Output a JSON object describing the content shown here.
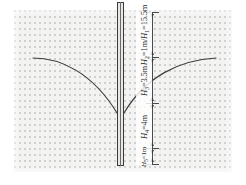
{
  "figure": {
    "type": "engineering-cross-section",
    "soil": {
      "fill": "stipple",
      "color": "#f3f3f1",
      "dot_color": "#6f6f6f"
    },
    "pile": {
      "name": "pile",
      "color": "#3a3a3a"
    },
    "curve_color": "#3c3c3c"
  },
  "dimensions": [
    {
      "id": "H2-H1",
      "label_plain": "H2=1m/H1=15.5m",
      "symbol_a": "H",
      "sub_a": "2",
      "mid": "=1m/",
      "symbol_b": "H",
      "sub_b": "1",
      "value": "=15.5m"
    },
    {
      "id": "H3",
      "label_plain": "H3=3.5m",
      "symbol_a": "H",
      "sub_a": "3",
      "value": "=3.5m"
    },
    {
      "id": "H4",
      "label_plain": "H4=4m",
      "symbol_a": "H",
      "sub_a": "4",
      "value": "=4m"
    },
    {
      "id": "H5",
      "label_plain": "H5=1m",
      "symbol_a": "H",
      "sub_a": "5",
      "value": "=1m"
    }
  ],
  "labels": {
    "h2h1": "H₂=1m/H₁=15.5m",
    "h3": "H₃=3.5m",
    "h4": "H₄=4m",
    "h5": "H₅=1m"
  }
}
